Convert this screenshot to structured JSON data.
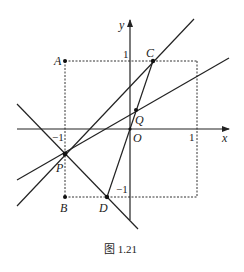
{
  "figure": {
    "caption": "图 1.21",
    "axes": {
      "x_label": "x",
      "y_label": "y",
      "origin_label": "O"
    },
    "ticks": {
      "x_neg": "−1",
      "x_pos": "1",
      "y_pos": "1",
      "y_neg": "−1"
    },
    "points": {
      "A": "A",
      "B": "B",
      "C": "C",
      "D": "D",
      "P": "P",
      "Q": "Q"
    },
    "colors": {
      "stroke": "#222222",
      "background": "#ffffff"
    }
  }
}
